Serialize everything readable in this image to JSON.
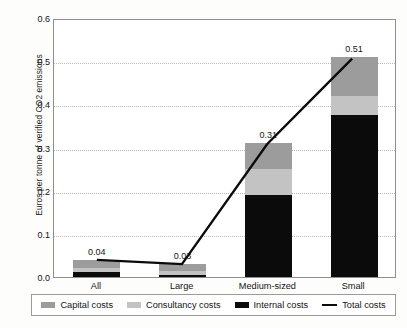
{
  "chart_data": {
    "type": "bar",
    "subtype": "stacked-bar-with-line-overlay",
    "title": "",
    "xlabel": "",
    "ylabel": "Euros per tonne of verified CO2 emissions",
    "ylim": [
      0.0,
      0.6
    ],
    "ytick_labels": [
      "0.0",
      "0.1",
      "0.2",
      "0.3",
      "0.4",
      "0.5",
      "0.6"
    ],
    "ytick_values": [
      0.0,
      0.1,
      0.2,
      0.3,
      0.4,
      0.5,
      0.6
    ],
    "grid": "horizontal-dotted",
    "legend_position": "bottom",
    "categories": [
      "All",
      "Large",
      "Medium-sized",
      "Small"
    ],
    "series": [
      {
        "name": "Internal costs",
        "color": "#0b0b0b",
        "values": [
          0.012,
          0.005,
          0.19,
          0.375
        ]
      },
      {
        "name": "Consultancy costs",
        "color": "#c3c3c3",
        "values": [
          0.008,
          0.01,
          0.06,
          0.045
        ]
      },
      {
        "name": "Capital costs",
        "color": "#9c9c9c",
        "values": [
          0.02,
          0.015,
          0.06,
          0.09
        ]
      },
      {
        "name": "Total costs",
        "color": "#0b0b0b",
        "type": "line",
        "values": [
          0.04,
          0.03,
          0.31,
          0.51
        ]
      }
    ],
    "data_labels": [
      "0.04",
      "0.03",
      "0.31",
      "0.51"
    ],
    "legend_entries": [
      {
        "label": "Capital costs",
        "color": "#9c9c9c",
        "marker": "swatch"
      },
      {
        "label": "Consultancy costs",
        "color": "#c3c3c3",
        "marker": "swatch"
      },
      {
        "label": "Internal costs",
        "color": "#0b0b0b",
        "marker": "swatch"
      },
      {
        "label": "Total costs",
        "color": "#0b0b0b",
        "marker": "line"
      }
    ]
  }
}
